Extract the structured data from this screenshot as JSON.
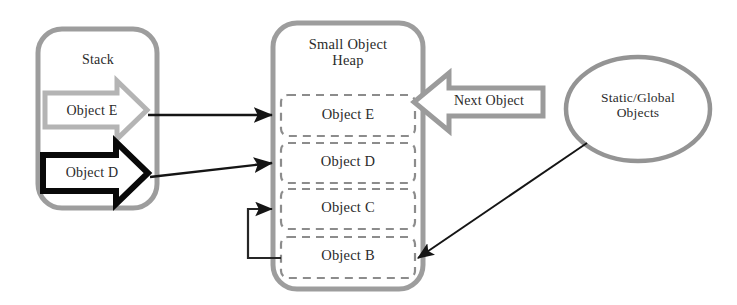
{
  "diagram": {
    "colors": {
      "container_border": "#9a9a9a",
      "slot_border": "#8a8a8a",
      "arrow_gray": "#a8a8a8",
      "arrow_black": "#0d0d0d",
      "connector": "#262626",
      "ellipse_border": "#8f8f8f",
      "text": "#2b2b2b",
      "background": "#ffffff"
    },
    "stack": {
      "label": "Stack",
      "arrows": [
        {
          "label": "Object E",
          "style": "gray-outline-block-arrow",
          "direction": "right"
        },
        {
          "label": "Object D",
          "style": "black-outline-block-arrow",
          "direction": "right"
        }
      ]
    },
    "heap": {
      "label": "Small Object\nHeap",
      "slots": [
        {
          "label": "Object E"
        },
        {
          "label": "Object D"
        },
        {
          "label": "Object C"
        },
        {
          "label": "Object B"
        }
      ]
    },
    "next_object": {
      "label": "Next Object",
      "style": "gray-outline-block-arrow",
      "direction": "left"
    },
    "static_global": {
      "label": "Static/Global\nObjects",
      "shape": "ellipse"
    },
    "connectors": [
      {
        "name": "stack-e-to-heap-e",
        "from": "Object E (stack)",
        "to": "Object E (heap)",
        "style": "straight-arrow"
      },
      {
        "name": "stack-d-to-heap-d",
        "from": "Object D (stack)",
        "to": "Object D (heap)",
        "style": "straight-arrow"
      },
      {
        "name": "heap-b-to-heap-c",
        "from": "Object B (heap)",
        "to": "Object C (heap)",
        "style": "elbow-arrow"
      },
      {
        "name": "static-global-to-heap-b",
        "from": "Static/Global Objects",
        "to": "Object B (heap)",
        "style": "diagonal-arrow"
      }
    ]
  }
}
